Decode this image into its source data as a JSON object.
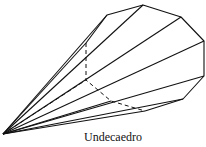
{
  "figure": {
    "caption": "Undecaedro",
    "stroke_color": "#111111",
    "apex": [
      3,
      134
    ],
    "base_vertices": [
      [
        107,
        15
      ],
      [
        143,
        5
      ],
      [
        181,
        17
      ],
      [
        204,
        41
      ],
      [
        204,
        76
      ],
      [
        183,
        99
      ],
      [
        145,
        111
      ],
      [
        111,
        101
      ],
      [
        86,
        80
      ],
      [
        86,
        43
      ]
    ],
    "visible_edges_from_apex": [
      [
        86,
        43
      ],
      [
        107,
        15
      ],
      [
        143,
        5
      ],
      [
        181,
        17
      ],
      [
        204,
        41
      ],
      [
        204,
        76
      ],
      [
        183,
        99
      ],
      [
        145,
        111
      ],
      [
        111,
        101
      ]
    ],
    "hidden_edges_from_apex": [
      [
        86,
        80
      ]
    ],
    "visible_base_path": [
      [
        86,
        43
      ],
      [
        107,
        15
      ],
      [
        143,
        5
      ],
      [
        181,
        17
      ],
      [
        204,
        41
      ],
      [
        204,
        76
      ],
      [
        183,
        99
      ],
      [
        145,
        111
      ]
    ],
    "hidden_base_path": [
      [
        86,
        43
      ],
      [
        86,
        80
      ],
      [
        111,
        101
      ],
      [
        145,
        111
      ]
    ]
  }
}
